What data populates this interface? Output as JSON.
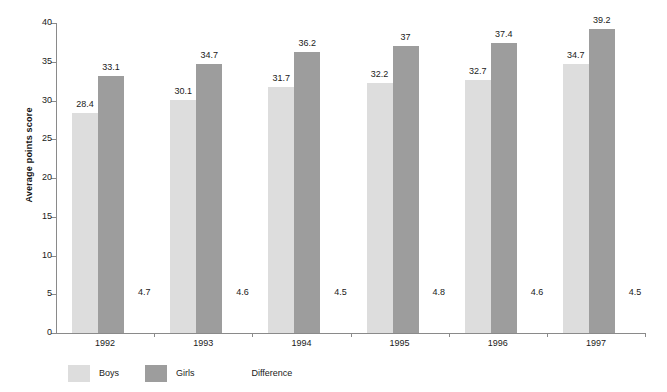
{
  "chart_data": {
    "type": "bar",
    "title": "",
    "subtitle": "",
    "xlabel": "",
    "ylabel": "Average points score",
    "categories": [
      "1992",
      "1993",
      "1994",
      "1995",
      "1996",
      "1997"
    ],
    "series": [
      {
        "name": "Boys",
        "color": "#dddddd",
        "values": [
          28.4,
          30.1,
          31.7,
          32.2,
          32.7,
          34.7
        ],
        "labels": [
          "28.4",
          "30.1",
          "31.7",
          "32.2",
          "32.7",
          "34.7"
        ]
      },
      {
        "name": "Girls",
        "color": "#9d9d9d",
        "values": [
          33.1,
          34.7,
          36.2,
          37,
          37.4,
          39.2
        ],
        "labels": [
          "33.1",
          "34.7",
          "36.2",
          "37",
          "37.4",
          "39.2"
        ]
      },
      {
        "name": "Difference",
        "color": "none",
        "values": [
          4.7,
          4.6,
          4.5,
          4.8,
          4.6,
          4.5
        ],
        "labels": [
          "4.7",
          "4.6",
          "4.5",
          "4.8",
          "4.6",
          "4.5"
        ]
      }
    ],
    "ylim": [
      0,
      40
    ],
    "yticks": [
      0,
      5,
      10,
      15,
      20,
      25,
      30,
      35,
      40
    ],
    "ytick_labels": [
      "0",
      "5",
      "10",
      "15",
      "20",
      "25",
      "30",
      "35",
      "40"
    ],
    "grid": false,
    "legend_position": "bottom-left",
    "legend": [
      {
        "label": "Boys",
        "color": "#dddddd",
        "swatch": true
      },
      {
        "label": "Girls",
        "color": "#9d9d9d",
        "swatch": true
      },
      {
        "label": "Difference",
        "color": "none",
        "swatch": false
      }
    ]
  },
  "axis": {
    "line_color": "#8a8a8a"
  }
}
